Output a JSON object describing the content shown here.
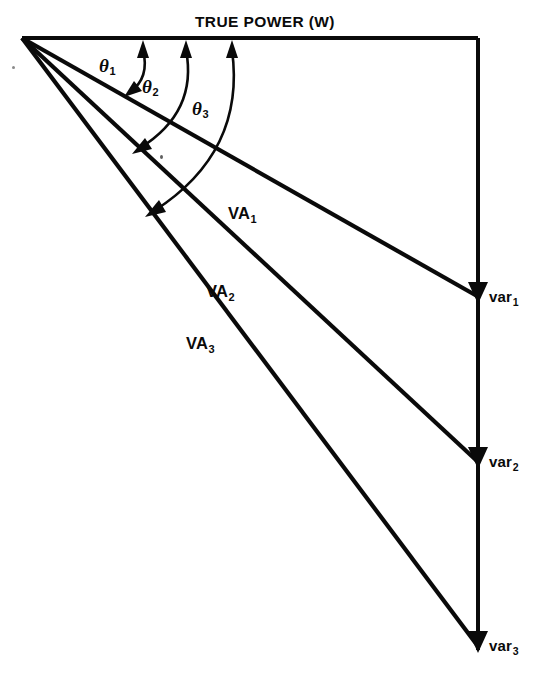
{
  "diagram": {
    "kind": "power-triangle-phasor-diagram",
    "title": "TRUE POWER (W)",
    "canvas": {
      "width": 537,
      "height": 686
    },
    "colors": {
      "line": "#0a0a0a",
      "background": "#ffffff"
    },
    "apex": {
      "x": 22,
      "y": 38
    },
    "axes": {
      "true_power": {
        "label": "TRUE POWER (W)",
        "from": {
          "x": 22,
          "y": 38
        },
        "to": {
          "x": 478,
          "y": 38
        }
      },
      "reactive": {
        "from": {
          "x": 478,
          "y": 38
        },
        "to": {
          "x": 478,
          "y": 652
        }
      }
    },
    "vectors": [
      {
        "name": "VA1",
        "label": "VA",
        "subscript": "1",
        "from": {
          "x": 22,
          "y": 38
        },
        "to": {
          "x": 478,
          "y": 297
        },
        "label_pos": {
          "x": 228,
          "y": 210
        },
        "endpoint_label": "var",
        "endpoint_subscript": "1",
        "endpoint_label_pos": {
          "x": 487,
          "y": 288
        }
      },
      {
        "name": "VA2",
        "label": "VA",
        "subscript": "2",
        "from": {
          "x": 22,
          "y": 38
        },
        "to": {
          "x": 478,
          "y": 462
        },
        "label_pos": {
          "x": 206,
          "y": 288
        },
        "endpoint_label": "var",
        "endpoint_subscript": "2",
        "endpoint_label_pos": {
          "x": 487,
          "y": 453
        }
      },
      {
        "name": "VA3",
        "label": "VA",
        "subscript": "3",
        "from": {
          "x": 22,
          "y": 38
        },
        "to": {
          "x": 478,
          "y": 646
        },
        "label_pos": {
          "x": 186,
          "y": 340
        },
        "endpoint_label": "var",
        "endpoint_subscript": "3",
        "endpoint_label_pos": {
          "x": 487,
          "y": 637
        }
      }
    ],
    "angles": [
      {
        "name": "theta1",
        "label": "θ",
        "subscript": "1",
        "label_pos": {
          "x": 99,
          "y": 57
        },
        "arc_top": {
          "x": 143,
          "y": 44
        },
        "arc_bottom": {
          "x": 128,
          "y": 95
        }
      },
      {
        "name": "theta2",
        "label": "θ",
        "subscript": "2",
        "label_pos": {
          "x": 142,
          "y": 78
        },
        "arc_top": {
          "x": 186,
          "y": 44
        },
        "arc_bottom": {
          "x": 137,
          "y": 152
        }
      },
      {
        "name": "theta3",
        "label": "θ",
        "subscript": "3",
        "label_pos": {
          "x": 192,
          "y": 100
        },
        "arc_top": {
          "x": 232,
          "y": 44
        },
        "arc_bottom": {
          "x": 150,
          "y": 215
        }
      }
    ]
  }
}
